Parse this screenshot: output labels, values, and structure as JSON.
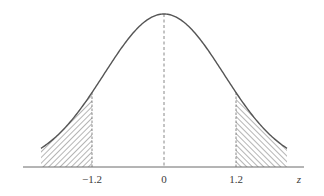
{
  "chart_data": {
    "type": "area",
    "title": "",
    "xlabel": "z",
    "ylabel": "",
    "xlim": [
      -2.05,
      2.05
    ],
    "x_ticks": [
      {
        "value": -1.2,
        "label": "−1.2"
      },
      {
        "value": 0,
        "label": "0"
      },
      {
        "value": 1.2,
        "label": "1.2"
      }
    ],
    "center_line": {
      "x": 0,
      "style": "dashed"
    },
    "cutoffs": [
      {
        "x": -1.2,
        "style": "dashed"
      },
      {
        "x": 1.2,
        "style": "dashed"
      }
    ],
    "shaded_regions": [
      {
        "from": -2.05,
        "to": -1.2,
        "fill": "hatch-forward"
      },
      {
        "from": 1.2,
        "to": 2.05,
        "fill": "hatch-backward"
      }
    ],
    "curve": {
      "distribution": "normal",
      "mean": 0,
      "sd": 1
    },
    "grid": false,
    "legend": null
  },
  "style": {
    "curve_color": "#555555",
    "axis_color": "#6a6a6a",
    "hatch_color": "#5a5a5a",
    "background": "#ffffff"
  },
  "layout": {
    "origin_x": 164,
    "axis_y": 167,
    "px_per_unit": 60,
    "peak_y": 14,
    "axis_x_start": 23,
    "axis_x_end": 304,
    "curve_x_min": -2.05,
    "curve_x_max": 2.05,
    "label_y": 183
  }
}
